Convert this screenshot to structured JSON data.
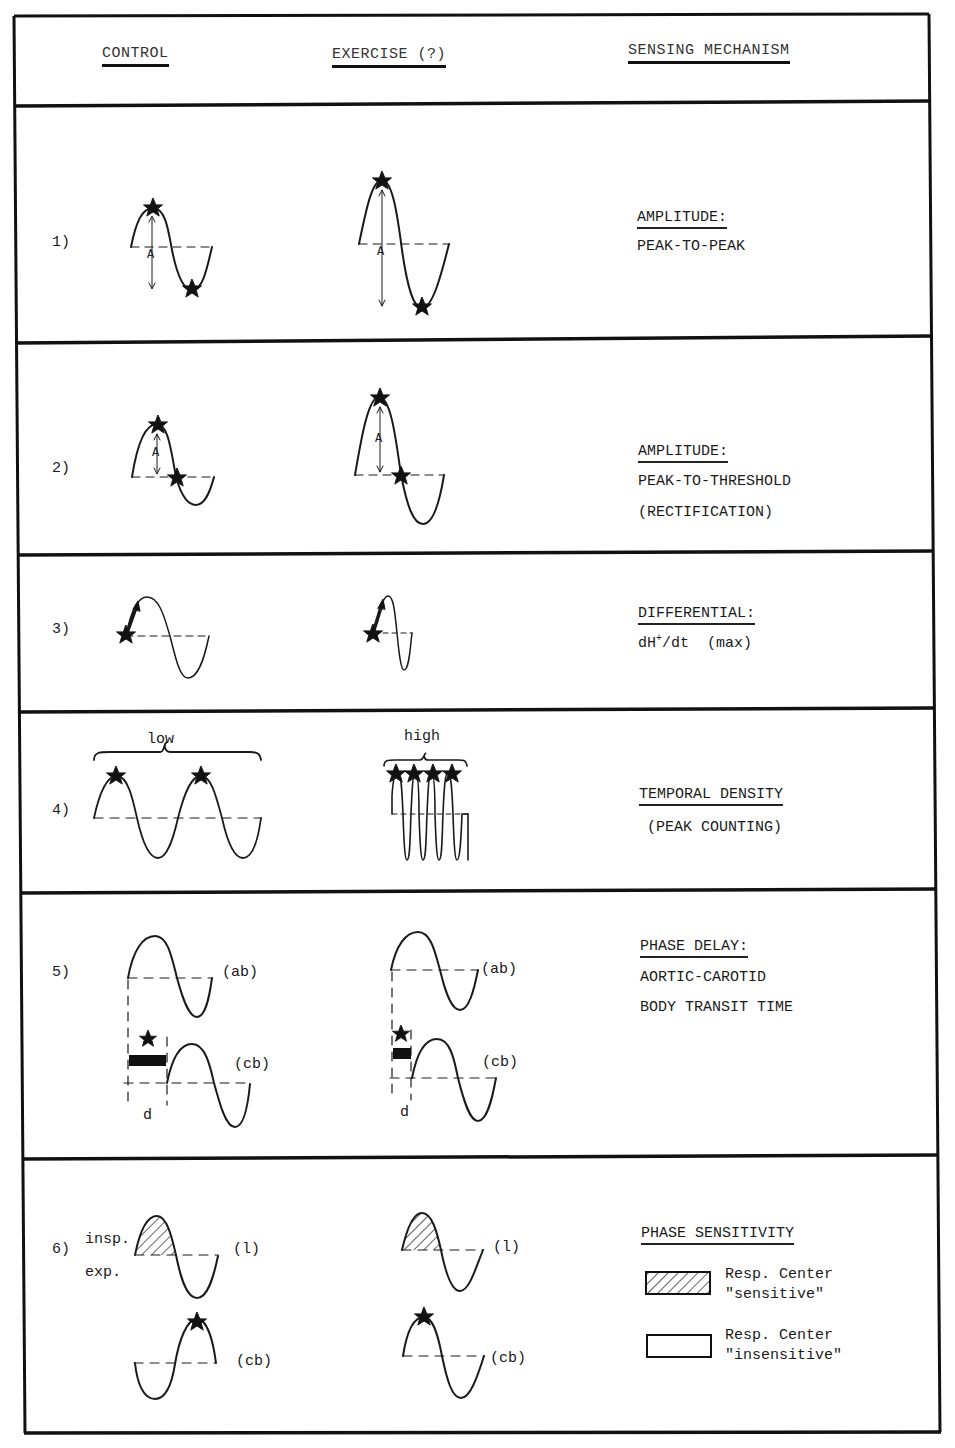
{
  "header": {
    "control": "CONTROL",
    "exercise": "EXERCISE (?)",
    "mechanism": "SENSING MECHANISM"
  },
  "rows": [
    {
      "number": "1)",
      "mechanism_title": "AMPLITUDE:",
      "mechanism_lines": [
        "PEAK-TO-PEAK"
      ],
      "amplitude_label": "A"
    },
    {
      "number": "2)",
      "mechanism_title": "AMPLITUDE:",
      "mechanism_lines": [
        "PEAK-TO-THRESHOLD",
        "(RECTIFICATION)"
      ],
      "amplitude_label": "A"
    },
    {
      "number": "3)",
      "mechanism_title": "DIFFERENTIAL:",
      "mechanism_formula_prefix": "dH",
      "mechanism_formula_sup": "+",
      "mechanism_formula_suffix": "/dt  (max)"
    },
    {
      "number": "4)",
      "mechanism_title": "TEMPORAL DENSITY",
      "mechanism_lines": [
        "(PEAK COUNTING)"
      ],
      "control_label": "low",
      "exercise_label": "high"
    },
    {
      "number": "5)",
      "mechanism_title": "PHASE DELAY:",
      "mechanism_lines": [
        "AORTIC-CAROTID",
        "BODY TRANSIT TIME"
      ],
      "wave_top_label": "(ab)",
      "wave_bottom_label": "(cb)",
      "delay_label": "d"
    },
    {
      "number": "6)",
      "mechanism_title": "PHASE SENSITIVITY",
      "insp_label": "insp.",
      "exp_label": "exp.",
      "wave_top_label": "(l)",
      "wave_bottom_label": "(cb)",
      "legend": [
        {
          "pattern": "hatched",
          "line1": "Resp. Center",
          "line2": "\"sensitive\""
        },
        {
          "pattern": "empty",
          "line1": "Resp. Center",
          "line2": "\"insensitive\""
        }
      ]
    }
  ],
  "colors": {
    "ink": "#1a1a1a",
    "paper": "#ffffff"
  }
}
